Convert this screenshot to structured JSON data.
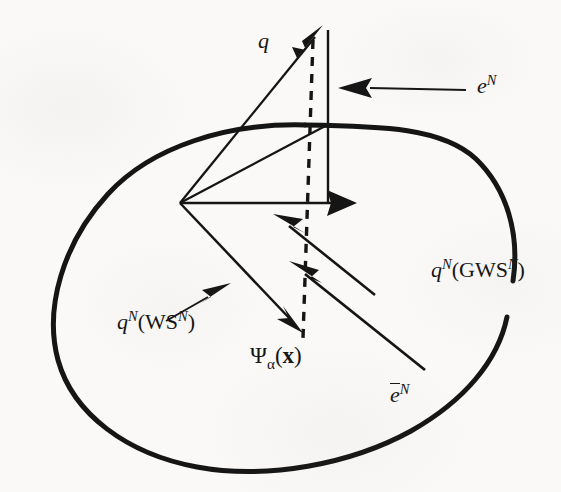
{
  "figure": {
    "domain": "diagram",
    "kind": "vector-decomposition-on-region",
    "background_color": "#faf9f7",
    "ink_color": "#151515"
  },
  "labels": {
    "q": {
      "name": "q",
      "base": "q",
      "sup": "",
      "sub": "",
      "text": "q"
    },
    "e_N": {
      "name": "e-superscript-N",
      "base": "e",
      "sup": "N",
      "sub": "",
      "text": "eN"
    },
    "q_N_GWS_N": {
      "name": "qN-GWS-N",
      "base": "q",
      "sup": "N",
      "inner_open": "(",
      "inner_rm": "GWS",
      "inner_sup": "N",
      "inner_close": ")",
      "text": "qN(GWSN)"
    },
    "q_N_WS_N": {
      "name": "qN-WS-N",
      "base": "q",
      "sup": "N",
      "inner_open": "(",
      "inner_rm": "WS",
      "inner_sup": "N",
      "inner_close": ")",
      "text": "qN(WSN)"
    },
    "psi_alpha_x": {
      "name": "psi-alpha-of-x",
      "base": "Ψ",
      "sub": "α",
      "open": "(",
      "arg": "x",
      "close": ")",
      "text": "Ψα(x)"
    },
    "e_bar_N": {
      "name": "e-bar-superscript-N",
      "base": "e",
      "sup": "N",
      "overbar": true,
      "text": "ēN"
    }
  },
  "geometry": {
    "region_boundary": {
      "name": "body-region-outline",
      "stroke_width": 5.0,
      "description": "closed rounded blob with a gap on the right side behind the qN(GWSN) label",
      "path_top": "M 305 125 C 225 124 150 147 106 195 C 62 243 44 308 58 359 C 73 413 126 453 196 466 C 266 479 350 464 410 431 C 463 402 497 362 506 318",
      "path_right_lower": "M 512 282 C 519 235 506 190 475 160 C 443 129 383 126 305 125"
    },
    "dashed_line": {
      "name": "dashed-projection-line",
      "x1": 313,
      "y1": 40,
      "x2": 303,
      "y2": 338,
      "dash": "9 8",
      "stroke_width": 3.4
    },
    "solid_vertical_line": {
      "name": "normal-axis-line",
      "x1": 328,
      "y1": 30,
      "x2": 328,
      "y2": 203,
      "stroke_width": 2.4
    },
    "vertex": {
      "name": "origin-vertex",
      "x": 180,
      "y": 203
    },
    "vectors": [
      {
        "name": "q-vector",
        "x1": 180,
        "y1": 203,
        "x2": 322,
        "y2": 28,
        "head": "arrow"
      },
      {
        "name": "upper-edge-line",
        "x1": 180,
        "y1": 203,
        "x2": 328,
        "y2": 124,
        "head": "none"
      },
      {
        "name": "qN-GWS-vector",
        "x1": 180,
        "y1": 203,
        "x2": 355,
        "y2": 203,
        "head": "arrow"
      },
      {
        "name": "qN-WS-vector",
        "x1": 180,
        "y1": 203,
        "x2": 300,
        "y2": 330,
        "head": "arrow"
      },
      {
        "name": "ebar-upper-vector",
        "x1": 375,
        "y1": 295,
        "x2": 276,
        "y2": 216,
        "head": "arrow"
      },
      {
        "name": "ebar-lower-vector",
        "x1": 425,
        "y1": 370,
        "x2": 292,
        "y2": 263,
        "head": "arrow"
      },
      {
        "name": "eN-pointer-arrow",
        "x1": 455,
        "y1": 92,
        "x2": 340,
        "y2": 88,
        "head": "arrow"
      },
      {
        "name": "qN-WS-pointer-arrow",
        "x1": 170,
        "y1": 318,
        "x2": 228,
        "y2": 285,
        "head": "arrow"
      }
    ]
  }
}
